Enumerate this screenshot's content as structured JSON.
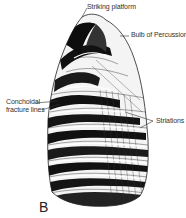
{
  "figure": {
    "panel_letter": "B",
    "labels": {
      "striking_platform": "Striking platform",
      "bulb_of_percussion": "Bulb of Percussion",
      "conchoidal_line1": "Conchoidal",
      "conchoidal_line2": "fracture lines",
      "striations": "Striations"
    },
    "colors": {
      "ink": "#111111",
      "label_text": "#333333",
      "background": "#ffffff"
    }
  }
}
